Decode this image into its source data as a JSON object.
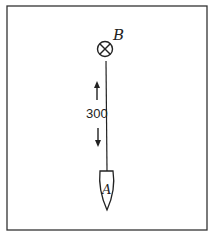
{
  "diagram": {
    "mark": {
      "label": "B",
      "symbol": "circle-with-x"
    },
    "boat": {
      "label": "A"
    },
    "distance": {
      "value": "300",
      "direction": "bidirectional-vertical"
    },
    "colors": {
      "ink": "#222222",
      "frame": "#333333",
      "background": "#ffffff"
    }
  }
}
